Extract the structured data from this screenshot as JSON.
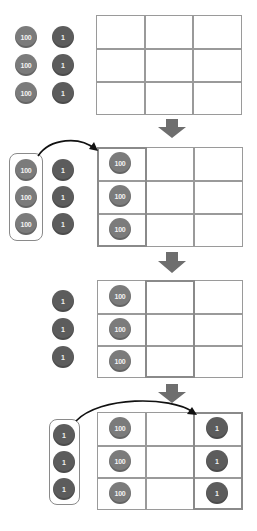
{
  "diagram": {
    "colors": {
      "hundred_chip": "#7b7b7b",
      "one_chip": "#5c5c5c",
      "grid_line": "#9a9a9a",
      "arrow": "#6e6e6e"
    },
    "chip_labels": {
      "hundred": "100",
      "one": "1"
    },
    "steps": [
      {
        "name": "step-1",
        "loose_hundreds": [
          "100",
          "100",
          "100"
        ],
        "loose_ones": [
          "1",
          "1",
          "1"
        ],
        "grid": {
          "rows": 3,
          "cols": 3,
          "highlight_col": null,
          "col1": [
            "",
            "",
            ""
          ],
          "col2": [
            "",
            "",
            ""
          ],
          "col3": [
            "",
            "",
            ""
          ]
        }
      },
      {
        "name": "step-2",
        "loose_hundreds_boxed": [
          "100",
          "100",
          "100"
        ],
        "loose_ones": [
          "1",
          "1",
          "1"
        ],
        "grid": {
          "rows": 3,
          "cols": 3,
          "highlight_col": 1,
          "col1": [
            "100",
            "100",
            "100"
          ],
          "col2": [
            "",
            "",
            ""
          ],
          "col3": [
            "",
            "",
            ""
          ]
        }
      },
      {
        "name": "step-3",
        "loose_ones": [
          "1",
          "1",
          "1"
        ],
        "grid": {
          "rows": 3,
          "cols": 3,
          "highlight_col": 2,
          "col1": [
            "100",
            "100",
            "100"
          ],
          "col2": [
            "",
            "",
            ""
          ],
          "col3": [
            "",
            "",
            ""
          ]
        }
      },
      {
        "name": "step-4",
        "loose_ones_boxed": [
          "1",
          "1",
          "1"
        ],
        "grid": {
          "rows": 3,
          "cols": 3,
          "highlight_col": 3,
          "col1": [
            "100",
            "100",
            "100"
          ],
          "col2": [
            "",
            "",
            ""
          ],
          "col3": [
            "1",
            "1",
            "1"
          ]
        }
      }
    ]
  }
}
